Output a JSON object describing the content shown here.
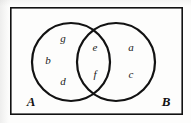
{
  "figure": {
    "kind": "venn-diagram",
    "width": 191,
    "height": 123,
    "background_color": "#fdfdfc",
    "stroke_color": "#121212",
    "border": {
      "name": "universal-set-rectangle",
      "x": 10,
      "y": 7,
      "width": 173,
      "height": 108,
      "stroke_width": 1.6
    },
    "circles": [
      {
        "name": "set-a-circle",
        "cx": 71,
        "cy": 62,
        "r": 39,
        "stroke_width": 2.2
      },
      {
        "name": "set-b-circle",
        "cx": 116,
        "cy": 62,
        "r": 39,
        "stroke_width": 2.2
      }
    ]
  },
  "labels": {
    "regions": [
      {
        "id": "g",
        "text": "g",
        "x": 63,
        "y": 38
      },
      {
        "id": "b",
        "text": "b",
        "x": 48,
        "y": 60
      },
      {
        "id": "d",
        "text": "d",
        "x": 63,
        "y": 81
      },
      {
        "id": "e",
        "text": "e",
        "x": 95,
        "y": 47
      },
      {
        "id": "f",
        "text": "f",
        "x": 95,
        "y": 74
      },
      {
        "id": "a",
        "text": "a",
        "x": 131,
        "y": 47
      },
      {
        "id": "c",
        "text": "c",
        "x": 131,
        "y": 74
      }
    ],
    "sets": [
      {
        "id": "A",
        "text": "A",
        "x": 31,
        "y": 101
      },
      {
        "id": "B",
        "text": "B",
        "x": 166,
        "y": 101
      }
    ]
  }
}
